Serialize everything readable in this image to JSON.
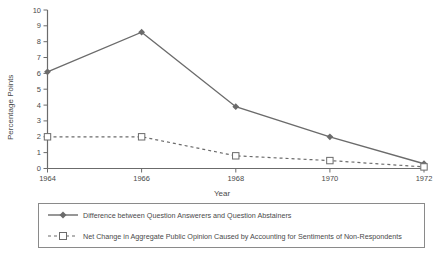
{
  "chart_data": {
    "type": "line",
    "title": "",
    "xlabel": "Year",
    "ylabel": "Percentage Points",
    "x": [
      1964,
      1966,
      1968,
      1970,
      1972
    ],
    "xtick_labels": [
      "1964",
      "1966",
      "1968",
      "1970",
      "1972"
    ],
    "ytick_labels": [
      "0",
      "1",
      "2",
      "3",
      "4",
      "5",
      "6",
      "7",
      "8",
      "9",
      "10"
    ],
    "ylim": [
      0,
      10
    ],
    "xlim": [
      1964,
      1972
    ],
    "grid": false,
    "legend_position": "bottom",
    "series": [
      {
        "name": "Difference between Question Answerers and Question Abstainers",
        "values": [
          6.1,
          8.6,
          3.9,
          2.0,
          0.3
        ],
        "marker": "filled-diamond",
        "line_style": "solid",
        "color": "#6b6b6b"
      },
      {
        "name": "Net Change in Aggregate Public Opinion Caused by Accounting for Sentiments of Non-Respondents",
        "values": [
          2.0,
          2.0,
          0.8,
          0.5,
          0.1
        ],
        "marker": "open-square",
        "line_style": "dashed",
        "color": "#6b6b6b"
      }
    ]
  },
  "axis": {
    "y_title": "Percentage Points",
    "x_title": "Year"
  },
  "legend": {
    "entries": [
      {
        "label": "Difference between Question Answerers and Question Abstainers"
      },
      {
        "label": "Net Change in Aggregate Public Opinion Caused by Accounting for Sentiments of Non-Respondents"
      }
    ]
  },
  "colors": {
    "line": "#6b6b6b",
    "axis": "#6b6b6b",
    "text": "#4a4a4a",
    "background": "#ffffff",
    "legend_border": "#8a8a8a"
  }
}
